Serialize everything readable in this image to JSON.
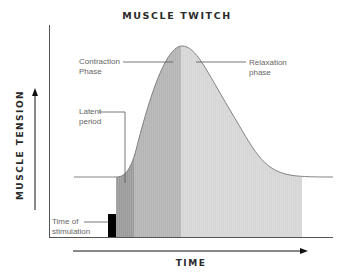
{
  "title": "MUSCLE TWITCH",
  "axes": {
    "x_label": "TIME",
    "y_label": "MUSCLE TENSION"
  },
  "labels": {
    "contraction_line1": "Contraction",
    "contraction_line2": "Phase",
    "relaxation_line1": "Relaxation",
    "relaxation_line2": "phase",
    "latent_line1": "Latent",
    "latent_line2": "period",
    "stim_line1": "Time of",
    "stim_line2": "stimulation"
  },
  "phases": [
    {
      "name": "Latent period",
      "color": "#9a9a9a"
    },
    {
      "name": "Contraction phase",
      "color": "#b4b4b4"
    },
    {
      "name": "Relaxation phase",
      "color": "#d6d6d6"
    }
  ],
  "colors": {
    "stimulation_marker": "#000000",
    "curve": "#777777",
    "axis": "#555555"
  }
}
